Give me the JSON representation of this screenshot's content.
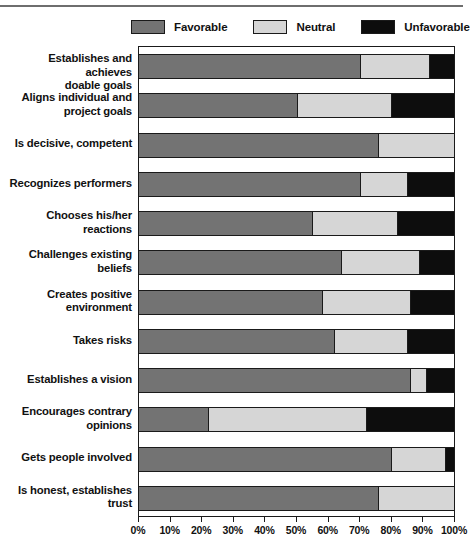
{
  "legend": {
    "items": [
      {
        "label": "Favorable",
        "key": "favorable",
        "color": "#737373"
      },
      {
        "label": "Neutral",
        "key": "neutral",
        "color": "#d6d6d6"
      },
      {
        "label": "Unfavorable",
        "key": "unfavorable",
        "color": "#0d0d0d"
      }
    ]
  },
  "chart_data": {
    "type": "bar",
    "orientation": "horizontal",
    "stacked": true,
    "title": "",
    "subtitle": "",
    "xlabel": "",
    "ylabel": "",
    "xlim": [
      0,
      100
    ],
    "xticks": [
      "0%",
      "10%",
      "20%",
      "30%",
      "40%",
      "50%",
      "60%",
      "70%",
      "80%",
      "90%",
      "100%"
    ],
    "xtick_values": [
      0,
      10,
      20,
      30,
      40,
      50,
      60,
      70,
      80,
      90,
      100
    ],
    "grid": false,
    "legend_position": "top",
    "units": "percent",
    "categories": [
      "Establishes and achieves doable goals",
      "Aligns individual and project goals",
      "Is decisive, competent",
      "Recognizes performers",
      "Chooses his/her reactions",
      "Challenges existing beliefs",
      "Creates positive environment",
      "Takes risks",
      "Establishes a vision",
      "Encourages contrary opinions",
      "Gets people involved",
      "Is honest, establishes trust"
    ],
    "category_lines": [
      [
        "Establishes and achieves",
        "doable goals"
      ],
      [
        "Aligns individual and",
        "project goals"
      ],
      [
        "Is decisive, competent"
      ],
      [
        "Recognizes performers"
      ],
      [
        "Chooses his/her",
        "reactions"
      ],
      [
        "Challenges existing",
        "beliefs"
      ],
      [
        "Creates positive",
        "environment"
      ],
      [
        "Takes risks"
      ],
      [
        "Establishes a vision"
      ],
      [
        "Encourages contrary",
        "opinions"
      ],
      [
        "Gets people involved"
      ],
      [
        "Is honest, establishes",
        "trust"
      ]
    ],
    "series": [
      {
        "name": "Favorable",
        "values": [
          70,
          50,
          76,
          70,
          55,
          64,
          58,
          62,
          86,
          22,
          80,
          76
        ]
      },
      {
        "name": "Neutral",
        "values": [
          22,
          30,
          24,
          15,
          27,
          25,
          28,
          23,
          5,
          50,
          17,
          24
        ]
      },
      {
        "name": "Unfavorable",
        "values": [
          8,
          20,
          0,
          15,
          18,
          11,
          14,
          15,
          9,
          28,
          3,
          0
        ]
      }
    ]
  }
}
